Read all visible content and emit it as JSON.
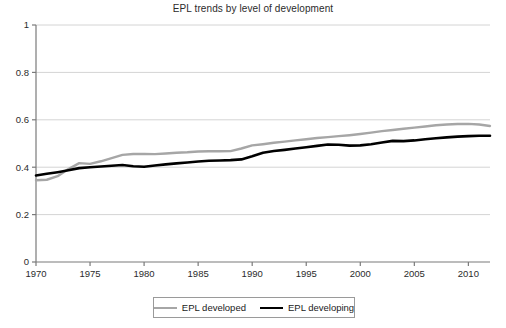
{
  "chart_data": {
    "type": "line",
    "title": "EPL trends by level of development",
    "xlabel": "",
    "ylabel": "",
    "xlim": [
      1970,
      2012
    ],
    "ylim": [
      0,
      1
    ],
    "grid": true,
    "grid_axis": "y",
    "legend_position": "bottom",
    "x_ticks": [
      1970,
      1975,
      1980,
      1985,
      1990,
      1995,
      2000,
      2005,
      2010
    ],
    "y_ticks": [
      0,
      0.2,
      0.4,
      0.6,
      0.8,
      1
    ],
    "x": [
      1970,
      1971,
      1972,
      1973,
      1974,
      1975,
      1976,
      1977,
      1978,
      1979,
      1980,
      1981,
      1982,
      1983,
      1984,
      1985,
      1986,
      1987,
      1988,
      1989,
      1990,
      1991,
      1992,
      1993,
      1994,
      1995,
      1996,
      1997,
      1998,
      1999,
      2000,
      2001,
      2002,
      2003,
      2004,
      2005,
      2006,
      2007,
      2008,
      2009,
      2010,
      2011,
      2012
    ],
    "series": [
      {
        "name": "EPL developed",
        "color": "#a6a6a6",
        "values": [
          0.345,
          0.347,
          0.362,
          0.392,
          0.417,
          0.414,
          0.425,
          0.438,
          0.452,
          0.456,
          0.456,
          0.455,
          0.458,
          0.461,
          0.463,
          0.466,
          0.467,
          0.467,
          0.468,
          0.479,
          0.492,
          0.497,
          0.503,
          0.508,
          0.513,
          0.518,
          0.523,
          0.527,
          0.531,
          0.535,
          0.54,
          0.546,
          0.552,
          0.557,
          0.562,
          0.567,
          0.572,
          0.577,
          0.58,
          0.582,
          0.583,
          0.58,
          0.574
        ]
      },
      {
        "name": "EPL developing",
        "color": "#000000",
        "values": [
          0.365,
          0.372,
          0.379,
          0.387,
          0.396,
          0.4,
          0.403,
          0.406,
          0.409,
          0.404,
          0.402,
          0.407,
          0.412,
          0.416,
          0.42,
          0.424,
          0.427,
          0.428,
          0.43,
          0.433,
          0.446,
          0.461,
          0.468,
          0.473,
          0.479,
          0.484,
          0.49,
          0.496,
          0.495,
          0.491,
          0.492,
          0.497,
          0.504,
          0.511,
          0.51,
          0.513,
          0.518,
          0.522,
          0.526,
          0.529,
          0.531,
          0.533,
          0.533
        ]
      }
    ]
  },
  "legend": {
    "entries": [
      {
        "label": "EPL developed"
      },
      {
        "label": "EPL developing"
      }
    ]
  }
}
